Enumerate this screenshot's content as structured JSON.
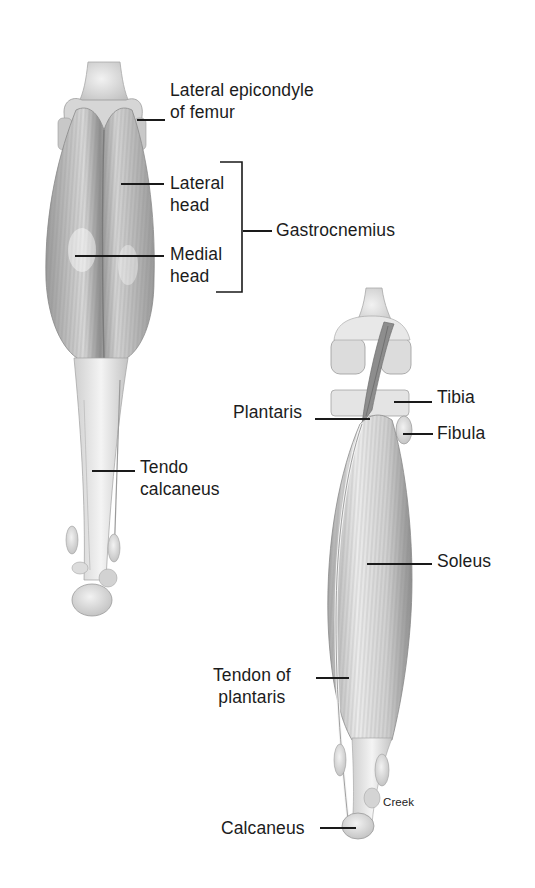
{
  "diagram": {
    "views": [
      {
        "id": "superficial",
        "description": "Posterior view, gastrocnemius",
        "labels": [
          {
            "id": "lateral-epicondyle",
            "lines": [
              "Lateral epicondyle",
              "of femur"
            ]
          },
          {
            "id": "lateral-head",
            "lines": [
              "Lateral",
              "head"
            ]
          },
          {
            "id": "medial-head",
            "lines": [
              "Medial",
              "head"
            ]
          },
          {
            "id": "gastrocnemius",
            "lines": [
              "Gastrocnemius"
            ],
            "groups": [
              "lateral-head",
              "medial-head"
            ]
          },
          {
            "id": "tendo-calcaneus",
            "lines": [
              "Tendo",
              "calcaneus"
            ]
          }
        ]
      },
      {
        "id": "deep",
        "description": "Posterior view, gastrocnemius removed",
        "labels": [
          {
            "id": "tibia",
            "lines": [
              "Tibia"
            ]
          },
          {
            "id": "plantaris",
            "lines": [
              "Plantaris"
            ]
          },
          {
            "id": "fibula",
            "lines": [
              "Fibula"
            ]
          },
          {
            "id": "soleus",
            "lines": [
              "Soleus"
            ]
          },
          {
            "id": "tendon-of-plantaris",
            "lines": [
              "Tendon of",
              "plantaris"
            ]
          },
          {
            "id": "calcaneus",
            "lines": [
              "Calcaneus"
            ]
          }
        ]
      }
    ],
    "credit": "Creek"
  },
  "colors": {
    "background": "#ffffff",
    "text": "#1c1c1c",
    "muscle_dark": "#8a8a8a",
    "muscle_mid": "#b8b8b8",
    "bone_light": "#e6e6e6"
  }
}
